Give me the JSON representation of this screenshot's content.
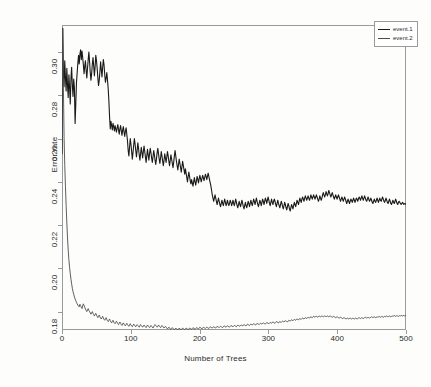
{
  "chart_data": {
    "type": "line",
    "title": "",
    "xlabel": "Number of Trees",
    "ylabel": "Error rate",
    "xlim": [
      0,
      500
    ],
    "ylim": [
      0.1715,
      0.3125
    ],
    "grid": false,
    "legend_position": "top-right",
    "x_ticks": [
      0,
      100,
      200,
      300,
      400,
      500
    ],
    "y_ticks": [
      0.18,
      0.2,
      0.22,
      0.24,
      0.26,
      0.28,
      0.3
    ],
    "x_tick_labels": [
      "0",
      "100",
      "200",
      "300",
      "400",
      "500"
    ],
    "y_tick_labels": [
      "0.18",
      "0.20",
      "0.22",
      "0.24",
      "0.26",
      "0.28",
      "0.30"
    ],
    "series": [
      {
        "name": "event.1",
        "color": "#1a1a1a",
        "width": 1.1,
        "values": [
          0.253,
          0.311,
          0.2905,
          0.284,
          0.296,
          0.288,
          0.282,
          0.2925,
          0.2845,
          0.279,
          0.2895,
          0.2835,
          0.276,
          0.288,
          0.293,
          0.2845,
          0.2795,
          0.2875,
          0.2835,
          0.267,
          0.276,
          0.286,
          0.2905,
          0.295,
          0.2985,
          0.2945,
          0.299,
          0.301,
          0.2965,
          0.3005,
          0.2975,
          0.294,
          0.29,
          0.2935,
          0.296,
          0.2915,
          0.288,
          0.2925,
          0.2965,
          0.3,
          0.2955,
          0.2905,
          0.287,
          0.29,
          0.2945,
          0.2975,
          0.2935,
          0.289,
          0.293,
          0.2985,
          0.296,
          0.2925,
          0.288,
          0.2845,
          0.287,
          0.291,
          0.2955,
          0.292,
          0.2885,
          0.293,
          0.2965,
          0.294,
          0.2895,
          0.286,
          0.288,
          0.2905,
          0.287,
          0.283,
          0.2775,
          0.27,
          0.2645,
          0.268,
          0.266,
          0.264,
          0.267,
          0.2655,
          0.2635,
          0.266,
          0.2645,
          0.263,
          0.265,
          0.2665,
          0.264,
          0.262,
          0.2645,
          0.266,
          0.2635,
          0.2615,
          0.264,
          0.2655,
          0.263,
          0.261,
          0.2635,
          0.265,
          0.262,
          0.259,
          0.2545,
          0.252,
          0.256,
          0.26,
          0.2575,
          0.254,
          0.2505,
          0.2535,
          0.257,
          0.26,
          0.2575,
          0.2545,
          0.2515,
          0.2545,
          0.258,
          0.2555,
          0.2525,
          0.25,
          0.253,
          0.256,
          0.2535,
          0.251,
          0.254,
          0.2565,
          0.254,
          0.2515,
          0.249,
          0.252,
          0.255,
          0.2525,
          0.25,
          0.253,
          0.2555,
          0.2535,
          0.251,
          0.249,
          0.2515,
          0.2545,
          0.2525,
          0.25,
          0.248,
          0.2505,
          0.2535,
          0.2555,
          0.253,
          0.2505,
          0.2485,
          0.251,
          0.254,
          0.252,
          0.2495,
          0.2475,
          0.25,
          0.253,
          0.251,
          0.249,
          0.2515,
          0.254,
          0.252,
          0.2495,
          0.2475,
          0.25,
          0.2525,
          0.2505,
          0.2485,
          0.2465,
          0.249,
          0.252,
          0.2545,
          0.252,
          0.2495,
          0.2475,
          0.2455,
          0.248,
          0.2505,
          0.2485,
          0.2465,
          0.2445,
          0.247,
          0.2495,
          0.2475,
          0.2455,
          0.2435,
          0.246,
          0.244,
          0.242,
          0.24,
          0.2425,
          0.2445,
          0.2425,
          0.2405,
          0.239,
          0.241,
          0.2395,
          0.238,
          0.24,
          0.242,
          0.24,
          0.2385,
          0.2405,
          0.2425,
          0.241,
          0.2395,
          0.2415,
          0.243,
          0.2415,
          0.24,
          0.2415,
          0.243,
          0.242,
          0.2405,
          0.242,
          0.2435,
          0.2425,
          0.241,
          0.2425,
          0.244,
          0.2425,
          0.241,
          0.2395,
          0.238,
          0.236,
          0.234,
          0.2325,
          0.231,
          0.2325,
          0.234,
          0.2325,
          0.231,
          0.2295,
          0.231,
          0.2325,
          0.231,
          0.2295,
          0.2285,
          0.23,
          0.2315,
          0.23,
          0.229,
          0.2305,
          0.232,
          0.2305,
          0.229,
          0.23,
          0.2315,
          0.23,
          0.229,
          0.23,
          0.2315,
          0.2305,
          0.229,
          0.23,
          0.2315,
          0.23,
          0.229,
          0.2305,
          0.232,
          0.2305,
          0.229,
          0.228,
          0.2295,
          0.231,
          0.2295,
          0.2285,
          0.23,
          0.2315,
          0.23,
          0.2285,
          0.2275,
          0.229,
          0.2305,
          0.229,
          0.228,
          0.2295,
          0.231,
          0.23,
          0.2285,
          0.23,
          0.2315,
          0.23,
          0.229,
          0.2305,
          0.232,
          0.231,
          0.2295,
          0.231,
          0.2325,
          0.231,
          0.2295,
          0.2285,
          0.23,
          0.2315,
          0.2305,
          0.229,
          0.2305,
          0.232,
          0.231,
          0.2295,
          0.231,
          0.2325,
          0.2315,
          0.23,
          0.2315,
          0.233,
          0.2315,
          0.23,
          0.229,
          0.2305,
          0.232,
          0.2305,
          0.2295,
          0.231,
          0.232,
          0.231,
          0.2295,
          0.2285,
          0.23,
          0.2315,
          0.23,
          0.229,
          0.228,
          0.2295,
          0.231,
          0.23,
          0.2285,
          0.2275,
          0.229,
          0.2305,
          0.2295,
          0.228,
          0.227,
          0.2285,
          0.23,
          0.229,
          0.2275,
          0.2265,
          0.228,
          0.2295,
          0.2285,
          0.2275,
          0.229,
          0.2305,
          0.2295,
          0.2285,
          0.23,
          0.2315,
          0.2305,
          0.2295,
          0.231,
          0.2325,
          0.2315,
          0.2305,
          0.232,
          0.233,
          0.232,
          0.231,
          0.2325,
          0.2335,
          0.2325,
          0.2315,
          0.2325,
          0.2335,
          0.2325,
          0.2315,
          0.2325,
          0.234,
          0.233,
          0.232,
          0.233,
          0.234,
          0.233,
          0.232,
          0.233,
          0.234,
          0.233,
          0.232,
          0.231,
          0.232,
          0.2335,
          0.2325,
          0.2315,
          0.2325,
          0.234,
          0.235,
          0.234,
          0.233,
          0.234,
          0.2355,
          0.2345,
          0.2335,
          0.2345,
          0.236,
          0.235,
          0.234,
          0.233,
          0.234,
          0.235,
          0.234,
          0.233,
          0.232,
          0.233,
          0.234,
          0.233,
          0.232,
          0.233,
          0.234,
          0.233,
          0.232,
          0.231,
          0.232,
          0.233,
          0.232,
          0.231,
          0.232,
          0.233,
          0.232,
          0.231,
          0.23,
          0.231,
          0.232,
          0.231,
          0.23,
          0.231,
          0.232,
          0.2315,
          0.2305,
          0.2315,
          0.2325,
          0.2315,
          0.2305,
          0.2315,
          0.2325,
          0.232,
          0.231,
          0.232,
          0.233,
          0.2325,
          0.2315,
          0.2325,
          0.2335,
          0.2325,
          0.2315,
          0.2325,
          0.2335,
          0.2325,
          0.2315,
          0.231,
          0.232,
          0.233,
          0.232,
          0.231,
          0.2315,
          0.2325,
          0.2315,
          0.2305,
          0.23,
          0.231,
          0.232,
          0.231,
          0.2305,
          0.2315,
          0.2325,
          0.2315,
          0.2305,
          0.2315,
          0.2325,
          0.2315,
          0.231,
          0.232,
          0.233,
          0.232,
          0.231,
          0.2305,
          0.2315,
          0.2325,
          0.2315,
          0.2305,
          0.23,
          0.231,
          0.232,
          0.231,
          0.23,
          0.2295,
          0.2305,
          0.2315,
          0.2305,
          0.23,
          0.231,
          0.232,
          0.231,
          0.23,
          0.2295,
          0.2305,
          0.231,
          0.2305,
          0.23,
          0.2295,
          0.23,
          0.2305,
          0.23,
          0.2295,
          0.23,
          0.23,
          0.2295
        ]
      },
      {
        "name": "event.2",
        "color": "#4d4d4d",
        "width": 0.9,
        "values": [
          0.253,
          0.311,
          0.284,
          0.261,
          0.2475,
          0.238,
          0.229,
          0.221,
          0.214,
          0.2085,
          0.204,
          0.2005,
          0.1975,
          0.195,
          0.1928,
          0.1908,
          0.1892,
          0.188,
          0.1868,
          0.1858,
          0.185,
          0.1843,
          0.1836,
          0.183,
          0.1826,
          0.1822,
          0.1834,
          0.1828,
          0.182,
          0.1814,
          0.1826,
          0.1836,
          0.1828,
          0.182,
          0.1812,
          0.1806,
          0.18,
          0.1808,
          0.1814,
          0.1806,
          0.18,
          0.1794,
          0.1788,
          0.1794,
          0.18,
          0.1792,
          0.1786,
          0.178,
          0.1786,
          0.1792,
          0.1784,
          0.1778,
          0.1772,
          0.1778,
          0.1784,
          0.1776,
          0.177,
          0.1766,
          0.1772,
          0.1778,
          0.177,
          0.1764,
          0.176,
          0.1766,
          0.1772,
          0.1764,
          0.1758,
          0.1754,
          0.176,
          0.1766,
          0.1758,
          0.1752,
          0.1748,
          0.1754,
          0.176,
          0.1752,
          0.1748,
          0.1744,
          0.175,
          0.1756,
          0.175,
          0.1744,
          0.174,
          0.1746,
          0.1752,
          0.1746,
          0.174,
          0.1736,
          0.1742,
          0.1748,
          0.1742,
          0.1738,
          0.1734,
          0.174,
          0.1746,
          0.174,
          0.1736,
          0.1732,
          0.1738,
          0.1744,
          0.1738,
          0.1734,
          0.173,
          0.1736,
          0.1742,
          0.1738,
          0.1734,
          0.173,
          0.1736,
          0.174,
          0.1736,
          0.1732,
          0.1728,
          0.1734,
          0.174,
          0.1736,
          0.1732,
          0.1728,
          0.1734,
          0.1738,
          0.1734,
          0.173,
          0.1726,
          0.1732,
          0.1738,
          0.1734,
          0.173,
          0.1726,
          0.173,
          0.1736,
          0.1732,
          0.1728,
          0.1724,
          0.173,
          0.1736,
          0.174,
          0.1736,
          0.1732,
          0.1728,
          0.1732,
          0.1738,
          0.1734,
          0.173,
          0.1726,
          0.173,
          0.1736,
          0.1732,
          0.1728,
          0.1724,
          0.1728,
          0.1732,
          0.1728,
          0.1724,
          0.172,
          0.1724,
          0.1728,
          0.1724,
          0.172,
          0.1718,
          0.1722,
          0.1726,
          0.1722,
          0.1718,
          0.1716,
          0.172,
          0.1724,
          0.172,
          0.1718,
          0.1716,
          0.172,
          0.1724,
          0.172,
          0.1718,
          0.1716,
          0.172,
          0.1724,
          0.1722,
          0.1718,
          0.1716,
          0.172,
          0.1724,
          0.1722,
          0.1718,
          0.1716,
          0.172,
          0.1724,
          0.1722,
          0.172,
          0.1718,
          0.1722,
          0.1726,
          0.1724,
          0.172,
          0.1718,
          0.1722,
          0.1726,
          0.1724,
          0.1722,
          0.172,
          0.1724,
          0.1728,
          0.1726,
          0.1722,
          0.172,
          0.1724,
          0.1728,
          0.1726,
          0.1724,
          0.1722,
          0.1726,
          0.1728,
          0.1726,
          0.1724,
          0.1722,
          0.1726,
          0.173,
          0.1728,
          0.1726,
          0.1724,
          0.1728,
          0.173,
          0.1728,
          0.1726,
          0.1724,
          0.1728,
          0.1732,
          0.173,
          0.1728,
          0.1726,
          0.173,
          0.1732,
          0.173,
          0.1728,
          0.1726,
          0.173,
          0.1734,
          0.1732,
          0.173,
          0.1728,
          0.1732,
          0.1734,
          0.1732,
          0.173,
          0.1728,
          0.1732,
          0.1736,
          0.1734,
          0.1732,
          0.173,
          0.1734,
          0.1736,
          0.1734,
          0.1732,
          0.173,
          0.1734,
          0.1738,
          0.1736,
          0.1734,
          0.1732,
          0.1736,
          0.1738,
          0.1736,
          0.1734,
          0.1738,
          0.174,
          0.1738,
          0.1736,
          0.1734,
          0.1738,
          0.1742,
          0.174,
          0.1738,
          0.1736,
          0.174,
          0.1742,
          0.174,
          0.1738,
          0.1742,
          0.1744,
          0.1742,
          0.174,
          0.1738,
          0.1742,
          0.1746,
          0.1744,
          0.1742,
          0.174,
          0.1744,
          0.1746,
          0.1744,
          0.1742,
          0.1746,
          0.1748,
          0.1746,
          0.1744,
          0.1742,
          0.1746,
          0.175,
          0.1748,
          0.1746,
          0.1744,
          0.1748,
          0.175,
          0.1748,
          0.1746,
          0.175,
          0.1752,
          0.175,
          0.1748,
          0.1746,
          0.175,
          0.1754,
          0.1752,
          0.175,
          0.1748,
          0.1752,
          0.1754,
          0.1752,
          0.175,
          0.1754,
          0.1756,
          0.1754,
          0.1752,
          0.1756,
          0.1758,
          0.1756,
          0.1754,
          0.1752,
          0.1756,
          0.176,
          0.1758,
          0.1756,
          0.176,
          0.1762,
          0.176,
          0.1758,
          0.1762,
          0.1764,
          0.1762,
          0.176,
          0.1764,
          0.1766,
          0.1764,
          0.1762,
          0.1766,
          0.1768,
          0.1766,
          0.1764,
          0.1768,
          0.177,
          0.1768,
          0.1766,
          0.177,
          0.1772,
          0.177,
          0.1768,
          0.1772,
          0.1774,
          0.1772,
          0.177,
          0.1774,
          0.1776,
          0.1774,
          0.1772,
          0.1776,
          0.1778,
          0.1776,
          0.1774,
          0.1778,
          0.1778,
          0.1776,
          0.1774,
          0.1778,
          0.178,
          0.1778,
          0.1776,
          0.1778,
          0.178,
          0.1778,
          0.1776,
          0.1778,
          0.178,
          0.1778,
          0.1776,
          0.1778,
          0.178,
          0.1778,
          0.1776,
          0.1778,
          0.178,
          0.1778,
          0.1776,
          0.1774,
          0.1776,
          0.1778,
          0.1776,
          0.1774,
          0.1772,
          0.1774,
          0.1776,
          0.1774,
          0.1772,
          0.177,
          0.1772,
          0.1774,
          0.1772,
          0.177,
          0.1768,
          0.177,
          0.1772,
          0.177,
          0.1768,
          0.1766,
          0.1768,
          0.177,
          0.1768,
          0.1766,
          0.1768,
          0.177,
          0.1768,
          0.1766,
          0.1768,
          0.177,
          0.1768,
          0.1766,
          0.1768,
          0.177,
          0.1768,
          0.1766,
          0.1768,
          0.177,
          0.1772,
          0.177,
          0.1768,
          0.177,
          0.1772,
          0.177,
          0.1768,
          0.177,
          0.1772,
          0.1774,
          0.1772,
          0.177,
          0.1772,
          0.1774,
          0.1772,
          0.177,
          0.1772,
          0.1774,
          0.1776,
          0.1774,
          0.1772,
          0.1774,
          0.1776,
          0.1774,
          0.1772,
          0.1774,
          0.1776,
          0.1774,
          0.1776,
          0.1778,
          0.1776,
          0.1774,
          0.1776,
          0.1778,
          0.1776,
          0.1774,
          0.1776,
          0.1778,
          0.1776,
          0.1778,
          0.178,
          0.1778,
          0.1776,
          0.1778,
          0.178,
          0.1778,
          0.1776,
          0.1778,
          0.178,
          0.1778,
          0.178,
          0.1782,
          0.178,
          0.1778,
          0.178,
          0.1782,
          0.178,
          0.1778,
          0.178,
          0.1782,
          0.178,
          0.1782,
          0.1782,
          0.178,
          0.1782,
          0.1782,
          0.178,
          0.1782,
          0.1782
        ]
      }
    ]
  }
}
